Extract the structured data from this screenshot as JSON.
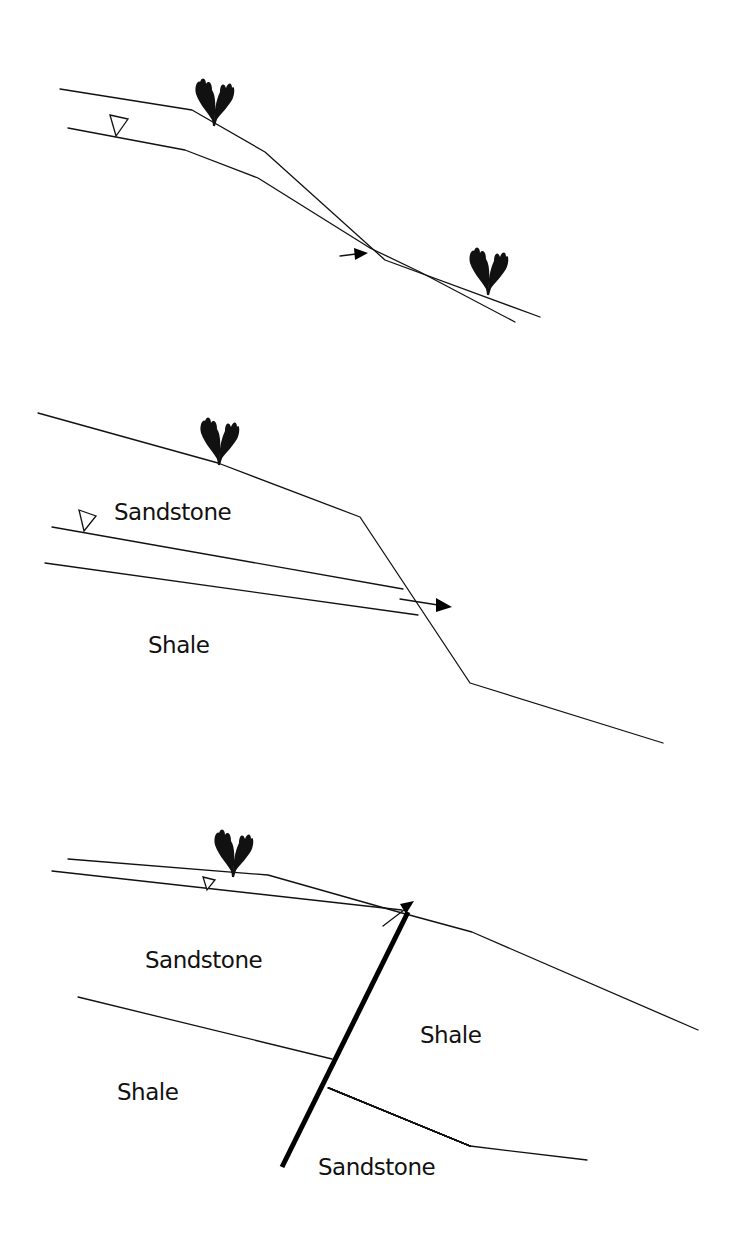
{
  "figure": {
    "panels": [
      {
        "id": "panel-1",
        "description": "Slope with water table seeping out at slope face",
        "labels": []
      },
      {
        "id": "panel-2",
        "description": "Sandstone over shale, seepage exits at slope face",
        "labels": {
          "upper_layer": "Sandstone",
          "lower_layer": "Shale"
        }
      },
      {
        "id": "panel-3",
        "description": "Faulted sandstone/shale sequence with seepage along fault",
        "labels": {
          "upper_left": "Sandstone",
          "right_block": "Shale",
          "lower_left": "Shale",
          "lower_right": "Sandstone"
        }
      }
    ],
    "symbols": {
      "water_table": "inverted-triangle",
      "vegetation": "shrub-icon",
      "flow": "arrow-icon"
    },
    "colors": {
      "ink": "#111111",
      "background": "#ffffff"
    }
  }
}
